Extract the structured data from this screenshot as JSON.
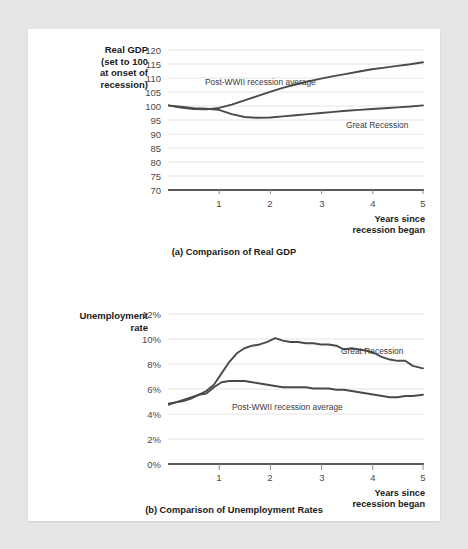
{
  "figure": {
    "background_color": "#e6e6e6",
    "panel_color": "#ffffff",
    "line_color": "#4a4a4a",
    "grid_color": "#e4e4e4",
    "axis_color": "#222222"
  },
  "charts": [
    {
      "id": "gdp",
      "caption": "(a) Comparison of Real GDP",
      "axis_title": "Real GDP\n(set to 100\nat onset of\nrecession)",
      "x_axis_label": "Years since\nrecession began",
      "yticks": [
        "120",
        "115",
        "110",
        "105",
        "100",
        "95",
        "90",
        "85",
        "80",
        "75",
        "70"
      ],
      "xticks": [
        "1",
        "2",
        "3",
        "4",
        "5"
      ],
      "series_labels": {
        "postwwii": "Post-WWII recession average",
        "great": "Great Recession"
      }
    },
    {
      "id": "unemployment",
      "caption": "(b) Comparison of Unemployment Rates",
      "axis_title": "Unemployment\nrate",
      "x_axis_label": "Years since\nrecession began",
      "yticks": [
        "12%",
        "10%",
        "8%",
        "6%",
        "4%",
        "2%",
        "0%"
      ],
      "xticks": [
        "1",
        "2",
        "3",
        "4",
        "5"
      ],
      "series_labels": {
        "great": "Great Recession",
        "postwwii": "Post-WWII recession average"
      }
    }
  ],
  "chart_data": [
    {
      "type": "line",
      "title": "(a) Comparison of Real GDP",
      "xlabel": "Years since recession began",
      "ylabel": "Real GDP (set to 100 at onset of recession)",
      "xlim": [
        0,
        5
      ],
      "ylim": [
        70,
        120
      ],
      "ytick_values": [
        70,
        75,
        80,
        85,
        90,
        95,
        100,
        105,
        110,
        115,
        120
      ],
      "xtick_values": [
        1,
        2,
        3,
        4,
        5
      ],
      "grid": true,
      "legend": "inline-labels",
      "x": [
        0,
        0.25,
        0.5,
        0.75,
        1.0,
        1.25,
        1.5,
        1.75,
        2.0,
        2.25,
        2.5,
        2.75,
        3.0,
        3.25,
        3.5,
        3.75,
        4.0,
        4.25,
        4.5,
        4.75,
        5.0
      ],
      "series": [
        {
          "name": "Post-WWII recession average",
          "values": [
            100.0,
            99.2,
            98.7,
            98.6,
            99.1,
            100.3,
            101.8,
            103.3,
            104.8,
            106.2,
            107.4,
            108.5,
            109.5,
            110.4,
            111.2,
            112.0,
            112.8,
            113.4,
            114.0,
            114.6,
            115.3
          ]
        },
        {
          "name": "Great Recession",
          "values": [
            100.0,
            99.5,
            99.0,
            98.8,
            98.4,
            96.9,
            95.9,
            95.6,
            95.7,
            96.1,
            96.5,
            96.9,
            97.3,
            97.7,
            98.1,
            98.4,
            98.7,
            99.0,
            99.3,
            99.6,
            100.0
          ]
        }
      ]
    },
    {
      "type": "line",
      "title": "(b) Comparison of Unemployment Rates",
      "xlabel": "Years since recession began",
      "ylabel": "Unemployment rate",
      "xlim": [
        0,
        5
      ],
      "ylim": [
        0,
        12
      ],
      "ytick_values": [
        0,
        2,
        4,
        6,
        8,
        10,
        12
      ],
      "xtick_values": [
        1,
        2,
        3,
        4,
        5
      ],
      "grid": true,
      "legend": "inline-labels",
      "x": [
        0,
        0.15,
        0.3,
        0.45,
        0.6,
        0.75,
        0.9,
        1.05,
        1.2,
        1.35,
        1.5,
        1.65,
        1.8,
        1.95,
        2.1,
        2.25,
        2.4,
        2.55,
        2.7,
        2.85,
        3.0,
        3.15,
        3.3,
        3.45,
        3.6,
        3.75,
        3.9,
        4.05,
        4.2,
        4.35,
        4.5,
        4.65,
        4.8,
        5.0
      ],
      "series": [
        {
          "name": "Great Recession",
          "values": [
            4.8,
            4.9,
            5.0,
            5.2,
            5.5,
            5.8,
            6.3,
            7.2,
            8.1,
            8.8,
            9.2,
            9.4,
            9.5,
            9.7,
            10.0,
            9.8,
            9.7,
            9.7,
            9.6,
            9.6,
            9.5,
            9.5,
            9.4,
            9.1,
            9.2,
            9.1,
            9.0,
            8.8,
            8.5,
            8.3,
            8.2,
            8.2,
            7.8,
            7.6
          ]
        },
        {
          "name": "Post-WWII recession average",
          "values": [
            4.7,
            4.9,
            5.1,
            5.3,
            5.5,
            5.6,
            6.1,
            6.5,
            6.6,
            6.6,
            6.6,
            6.5,
            6.4,
            6.3,
            6.2,
            6.1,
            6.1,
            6.1,
            6.1,
            6.0,
            6.0,
            6.0,
            5.9,
            5.9,
            5.8,
            5.7,
            5.6,
            5.5,
            5.4,
            5.3,
            5.3,
            5.4,
            5.4,
            5.5
          ]
        }
      ]
    }
  ]
}
